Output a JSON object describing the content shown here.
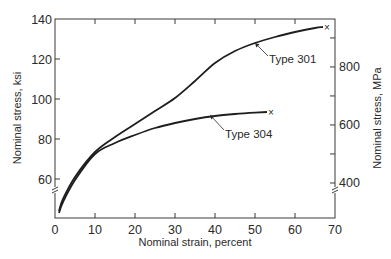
{
  "chart_data": {
    "type": "line",
    "title": "",
    "xlabel": "Nominal strain, percent",
    "ylabel": "Nominal stress, ksi",
    "ylabel_right": "Nominal stress, MPa",
    "xlim": [
      0,
      70
    ],
    "ylim": [
      40,
      140
    ],
    "ylim_right_MPa": [
      276,
      965
    ],
    "x_ticks": [
      0,
      10,
      20,
      30,
      40,
      50,
      60,
      70
    ],
    "y_ticks": [
      60,
      80,
      100,
      120,
      140
    ],
    "y_right_ticks": [
      400,
      500,
      600,
      700,
      800,
      900
    ],
    "y_right_tick_labels": [
      400,
      600,
      800
    ],
    "axis_break": true,
    "grid": false,
    "legend": "none (curves labeled directly with arrows)",
    "series": [
      {
        "name": "Type 301",
        "x": [
          1,
          2,
          5,
          10,
          15,
          20,
          25,
          30,
          35,
          40,
          45,
          50,
          55,
          60,
          65,
          67
        ],
        "y": [
          44,
          50,
          61,
          73.5,
          81,
          87.5,
          94,
          100.5,
          109,
          118,
          124,
          128,
          131,
          133.5,
          135.5,
          136
        ],
        "end_marker": "x"
      },
      {
        "name": "Type 304",
        "x": [
          1,
          2,
          5,
          10,
          15,
          20,
          25,
          30,
          35,
          40,
          45,
          50,
          53
        ],
        "y": [
          43,
          48.5,
          59.5,
          72.5,
          78,
          82,
          85.5,
          88,
          90,
          91.5,
          92.5,
          93.2,
          93.5
        ],
        "end_marker": "x"
      }
    ],
    "annotations": [
      {
        "text": "Type 301",
        "points_to_series": "Type 301"
      },
      {
        "text": "Type 304",
        "points_to_series": "Type 304"
      }
    ]
  },
  "labels": {
    "xlabel": "Nominal strain, percent",
    "ylabel": "Nominal stress, ksi",
    "ylabel_right": "Nominal stress, MPa",
    "ann_301": "Type 301",
    "ann_304": "Type 304"
  },
  "style": {
    "line_color": "#1e1e1e",
    "axis_color": "#3a3a3a",
    "background": "#ffffff"
  }
}
